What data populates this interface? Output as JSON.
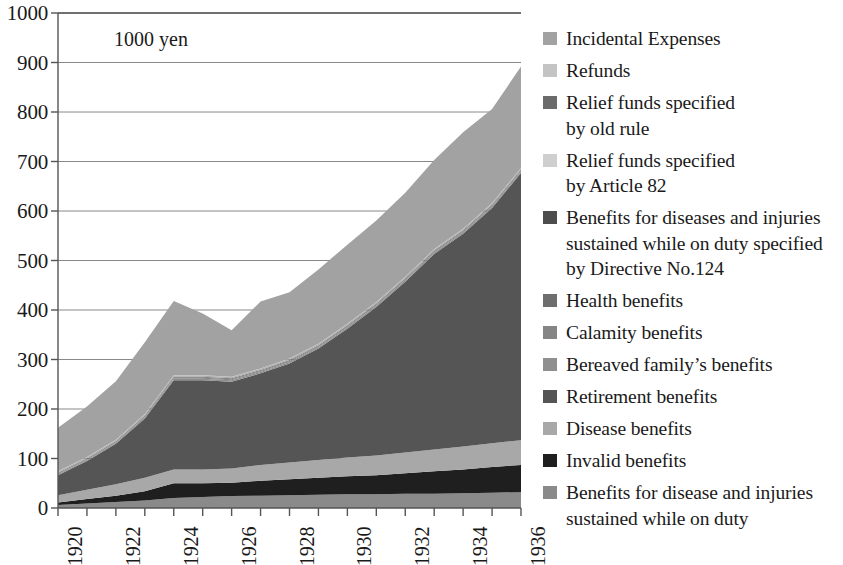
{
  "chart_data": {
    "type": "area",
    "stacked": true,
    "title": "",
    "subtitle": "",
    "annotation": "1000  yen",
    "xlabel": "",
    "ylabel": "",
    "ylim": [
      0,
      1000
    ],
    "ytick_labels": [
      "0",
      "100",
      "200",
      "300",
      "400",
      "500",
      "600",
      "700",
      "800",
      "900",
      "1000"
    ],
    "ytick_values": [
      0,
      100,
      200,
      300,
      400,
      500,
      600,
      700,
      800,
      900,
      1000
    ],
    "grid": true,
    "legend_position": "right",
    "x": [
      1920,
      1921,
      1922,
      1923,
      1924,
      1925,
      1926,
      1927,
      1928,
      1929,
      1930,
      1931,
      1932,
      1933,
      1934,
      1935,
      1936
    ],
    "xtick_labels": [
      "1920",
      "1922",
      "1924",
      "1926",
      "1928",
      "1930",
      "1932",
      "1934",
      "1936"
    ],
    "xtick_values": [
      1920,
      1922,
      1924,
      1926,
      1928,
      1930,
      1932,
      1934,
      1936
    ],
    "series": [
      {
        "name": "Benefits for disease and injuries sustained while on duty",
        "label": "Benefits for disease and injuries\nsustained while on duty",
        "color": "#8a8a8a",
        "values": [
          6,
          9,
          12,
          15,
          20,
          22,
          24,
          25,
          26,
          27,
          28,
          28,
          29,
          29,
          30,
          31,
          32
        ]
      },
      {
        "name": "Invalid benefits",
        "label": "Invalid benefits",
        "color": "#1f1f1f",
        "values": [
          5,
          9,
          13,
          19,
          30,
          28,
          27,
          30,
          32,
          34,
          36,
          38,
          41,
          45,
          48,
          52,
          55
        ]
      },
      {
        "name": "Disease benefits",
        "label": "Disease benefits",
        "color": "#a8a8a8",
        "values": [
          15,
          19,
          23,
          27,
          28,
          28,
          29,
          32,
          34,
          36,
          38,
          40,
          42,
          44,
          46,
          48,
          50
        ]
      },
      {
        "name": "Retirement benefits",
        "label": "Retirement benefits",
        "color": "#555555",
        "values": [
          40,
          58,
          82,
          120,
          180,
          180,
          175,
          185,
          200,
          225,
          260,
          300,
          345,
          395,
          430,
          475,
          540
        ]
      },
      {
        "name": "Bereaved family's benefits",
        "label": "Bereaved family’s benefits",
        "color": "#8f8f8f",
        "values": [
          2,
          2,
          2,
          3,
          3,
          3,
          3,
          3,
          3,
          3,
          3,
          3,
          3,
          3,
          3,
          3,
          3
        ]
      },
      {
        "name": "Calamity benefits",
        "label": "Calamity benefits",
        "color": "#858585",
        "values": [
          1,
          1,
          1,
          1,
          2,
          2,
          2,
          2,
          2,
          2,
          2,
          2,
          2,
          2,
          2,
          2,
          2
        ]
      },
      {
        "name": "Health benefits",
        "label": "Health benefits",
        "color": "#6e6e6e",
        "values": [
          1,
          1,
          1,
          1,
          1,
          1,
          1,
          1,
          1,
          1,
          1,
          1,
          1,
          1,
          1,
          1,
          1
        ]
      },
      {
        "name": "Benefits for diseases and injuries sustained while on duty specified by Directive No.124",
        "label": "Benefits for diseases and injuries\nsustained while on duty specified\nby Directive No.124",
        "color": "#4d4d4d",
        "values": [
          1,
          1,
          1,
          1,
          1,
          1,
          1,
          1,
          1,
          1,
          1,
          1,
          1,
          1,
          1,
          1,
          1
        ]
      },
      {
        "name": "Relief funds specified by Article 82",
        "label": "Relief funds specified\nby Article 82",
        "color": "#cfcfcf",
        "values": [
          1,
          1,
          1,
          1,
          1,
          1,
          1,
          1,
          1,
          1,
          1,
          1,
          1,
          1,
          1,
          1,
          1
        ]
      },
      {
        "name": "Relief funds specified by old rule",
        "label": "Relief funds specified\nby old rule",
        "color": "#6b6b6b",
        "values": [
          1,
          1,
          1,
          1,
          1,
          1,
          1,
          1,
          1,
          1,
          1,
          1,
          1,
          1,
          1,
          1,
          1
        ]
      },
      {
        "name": "Refunds",
        "label": "Refunds",
        "color": "#c4c4c4",
        "values": [
          1,
          1,
          1,
          1,
          1,
          1,
          1,
          1,
          1,
          1,
          1,
          1,
          1,
          1,
          1,
          1,
          1
        ]
      },
      {
        "name": "Incidental Expenses",
        "label": "Incidental Expenses",
        "color": "#a2a2a2",
        "values": [
          88,
          102,
          118,
          145,
          150,
          125,
          94,
          135,
          134,
          150,
          160,
          165,
          170,
          180,
          195,
          190,
          205
        ]
      }
    ],
    "totals": [
      161,
      204,
      255,
      333,
      486,
      441,
      417,
      475,
      474,
      520,
      569,
      619,
      677,
      745,
      787,
      844,
      890
    ],
    "legend_order": [
      "Incidental Expenses",
      "Refunds",
      "Relief funds specified by old rule",
      "Relief funds specified by Article 82",
      "Benefits for diseases and injuries sustained while on duty specified by Directive No.124",
      "Health benefits",
      "Calamity benefits",
      "Bereaved family's benefits",
      "Retirement benefits",
      "Disease benefits",
      "Invalid benefits",
      "Benefits for disease and injuries sustained while on duty"
    ]
  },
  "axis": {
    "color": "#555555",
    "grid_color": "#888888"
  }
}
